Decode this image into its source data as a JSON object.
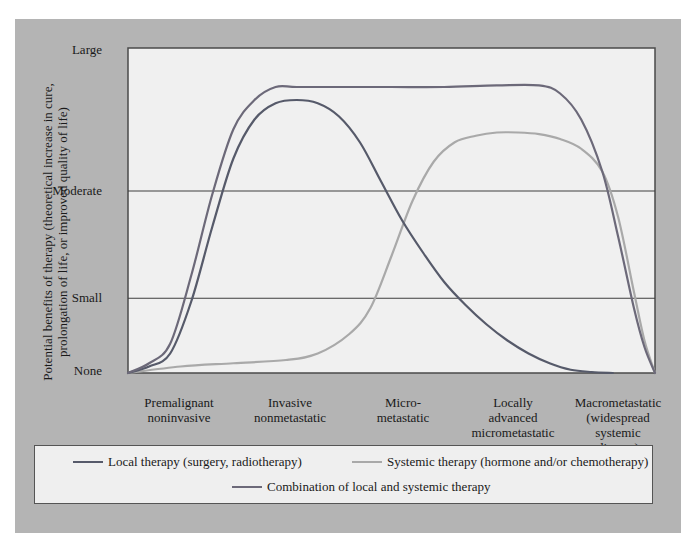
{
  "chart_data": {
    "type": "line",
    "title": "",
    "xlabel": "",
    "ylabel": "Potential benefits of therapy (theoretical increase in cure, prolongation of life, or improved quality of life)",
    "ylabel_lines": [
      "Potential benefits of therapy (theoretical increase in cure,",
      "prolongation of life, or improved quality of life)"
    ],
    "y_ticks": [
      "None",
      "Small",
      "Moderate",
      "Large"
    ],
    "y_tick_values": [
      0,
      23,
      56,
      100
    ],
    "ylim": [
      0,
      100
    ],
    "x_categories": [
      "Premalignant\nnoninvasive",
      "Invasive\nnonmetastatic",
      "Micro-\nmetastatic",
      "Locally\nadvanced\nmicrometastatic",
      "Macrometastatic\n(widespread\nsystemic\ndisease)"
    ],
    "x_category_positions": [
      0.08,
      0.29,
      0.5,
      0.71,
      0.92
    ],
    "xlim": [
      0,
      1
    ],
    "grid": {
      "horizontal_lines_at": [
        23,
        56
      ],
      "vertical": false
    },
    "legend_position": "bottom",
    "series": [
      {
        "name": "Local therapy (surgery, radiotherapy)",
        "color": "#565a6a",
        "x": [
          0.0,
          0.04,
          0.08,
          0.12,
          0.16,
          0.2,
          0.24,
          0.28,
          0.32,
          0.36,
          0.4,
          0.44,
          0.48,
          0.52,
          0.56,
          0.6,
          0.64,
          0.68,
          0.72,
          0.76,
          0.8,
          0.84,
          0.88,
          0.92
        ],
        "values": [
          0,
          2,
          6,
          22,
          45,
          66,
          78,
          83,
          84,
          83,
          79,
          71,
          59,
          47,
          37,
          28,
          21,
          15,
          10,
          6,
          3,
          1,
          0.3,
          0
        ]
      },
      {
        "name": "Systemic therapy (hormone and/or chemotherapy)",
        "color": "#a9a9a9",
        "x": [
          0.0,
          0.1,
          0.2,
          0.3,
          0.36,
          0.42,
          0.46,
          0.5,
          0.54,
          0.58,
          0.62,
          0.66,
          0.7,
          0.74,
          0.78,
          0.82,
          0.86,
          0.9,
          0.93,
          0.96,
          0.98,
          1.0
        ],
        "values": [
          0,
          2,
          3,
          4,
          6,
          12,
          20,
          36,
          53,
          65,
          71,
          73,
          74,
          74,
          73.5,
          72,
          69,
          62,
          48,
          25,
          10,
          0
        ]
      },
      {
        "name": "Combination of local and systemic therapy",
        "color": "#6c6979",
        "x": [
          0.0,
          0.04,
          0.08,
          0.12,
          0.16,
          0.2,
          0.24,
          0.28,
          0.32,
          0.4,
          0.5,
          0.6,
          0.7,
          0.78,
          0.82,
          0.86,
          0.9,
          0.93,
          0.96,
          0.98,
          1.0
        ],
        "values": [
          0,
          3,
          9,
          30,
          55,
          75,
          84,
          88,
          88,
          88,
          88,
          88,
          88.5,
          88.5,
          86,
          78,
          62,
          42,
          20,
          8,
          0
        ]
      }
    ]
  },
  "legend": {
    "items": [
      {
        "label": "Local therapy (surgery, radiotherapy)",
        "color": "#565a6a"
      },
      {
        "label": "Systemic therapy (hormone and/or chemotherapy)",
        "color": "#a9a9a9"
      },
      {
        "label": "Combination of local and systemic therapy",
        "color": "#6c6979"
      }
    ]
  },
  "colors": {
    "panel_bg": "#b4b4b4",
    "plot_bg": "#f0f0f0",
    "axis": "#4a4a4a",
    "grid": "#3e3e3e"
  }
}
